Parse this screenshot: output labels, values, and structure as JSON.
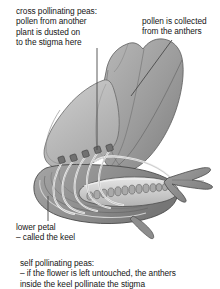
{
  "diagram": {
    "background_color": "#ffffff",
    "text_color": "#151515"
  },
  "annotations": {
    "cross_pollinating": {
      "name": "cross-pollinating-caption",
      "text": "cross pollinating peas:\npollen from another\nplant is dusted on\nto the stigma here",
      "lines": [
        "cross pollinating peas:",
        "pollen from another",
        "plant is dusted on",
        "to the stigma here"
      ]
    },
    "anthers": {
      "name": "pollen-collected-caption",
      "text": "pollen is collected\nfrom the anthers",
      "lines": [
        "pollen is collected",
        "from the anthers"
      ]
    },
    "lower_petal": {
      "name": "lower-petal-caption",
      "text": "lower petal\n– called the keel",
      "lines": [
        "lower petal",
        "– called the keel"
      ]
    },
    "self_pollinating": {
      "name": "self-pollinating-caption",
      "text": "self pollinating peas:\n– if the flower is left untouched, the anthers\ninside the keel pollinate the stigma",
      "lines": [
        "self pollinating peas:",
        "– if the flower is left untouched, the anthers",
        "inside the keel pollinate the stigma"
      ]
    }
  },
  "illustration": {
    "parts": [
      {
        "name": "standard-petal",
        "label": "standard petal (banner)",
        "fill": "#9c9c9c"
      },
      {
        "name": "wing-petal",
        "label": "wing petal",
        "fill": "#b4b4b4"
      },
      {
        "name": "keel-petal",
        "label": "keel (lower petal)",
        "fill": "#8f8f8f"
      },
      {
        "name": "stamen-filaments",
        "label": "stamen filaments",
        "fill": "#f2f2f2"
      },
      {
        "name": "anthers",
        "label": "anthers",
        "fill": "#6e6e6e"
      },
      {
        "name": "ovary",
        "label": "ovary",
        "fill": "#c8c8c8"
      },
      {
        "name": "ovules",
        "label": "ovules",
        "fill": "#a8a8a8"
      },
      {
        "name": "style-stigma",
        "label": "style and stigma",
        "fill": "#ededed"
      },
      {
        "name": "sepals",
        "label": "sepals",
        "fill": "#8a8a8a"
      }
    ],
    "ovule_count": 13,
    "anther_count": 5,
    "leader_lines": [
      {
        "name": "leader-cross-pollination",
        "from": [
          97,
          48
        ],
        "to": [
          97,
          150
        ]
      },
      {
        "name": "leader-anthers",
        "from": [
          172,
          40
        ],
        "to": [
          131,
          96
        ]
      },
      {
        "name": "leader-lower-petal",
        "from": [
          48,
          196
        ],
        "to": [
          48,
          221
        ]
      }
    ],
    "palette": {
      "outline": "#3a3a3a",
      "mid_grey": "#9c9c9c",
      "light_grey": "#c9c9c9",
      "dark_grey": "#6e6e6e",
      "highlight": "#f4f4f4"
    }
  }
}
